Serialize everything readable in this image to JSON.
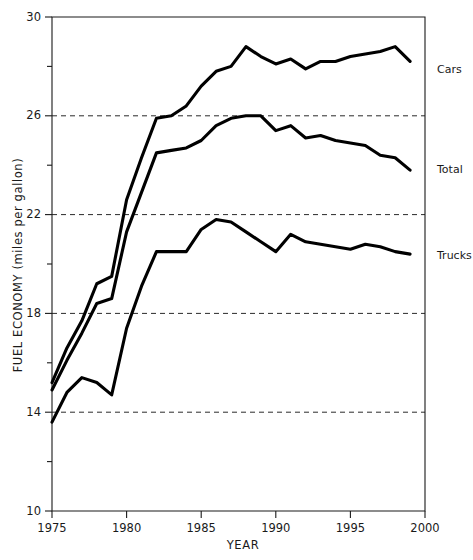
{
  "chart_data": {
    "type": "line",
    "title": "",
    "xlabel": "YEAR",
    "ylabel": "FUEL ECONOMY (miles per gallon)",
    "xlim": [
      1975,
      2000
    ],
    "ylim": [
      10,
      30
    ],
    "grid": true,
    "gridlines_y": [
      14,
      18,
      22,
      26
    ],
    "legend_position": "right-inline-labels",
    "x_major_ticks": [
      1975,
      1980,
      1985,
      1990,
      1995,
      2000
    ],
    "x_major_tick_labels": [
      "1975",
      "1980",
      "1985",
      "1990",
      "1995",
      "2000"
    ],
    "y_major_ticks": [
      10,
      14,
      18,
      22,
      26,
      30
    ],
    "y_major_tick_labels": [
      "10",
      "14",
      "18",
      "22",
      "26",
      "30"
    ],
    "y_minor_ticks": [
      12,
      16,
      20,
      24,
      28
    ],
    "x": [
      1975,
      1976,
      1977,
      1978,
      1979,
      1980,
      1981,
      1982,
      1983,
      1984,
      1985,
      1986,
      1987,
      1988,
      1989,
      1990,
      1991,
      1992,
      1993,
      1994,
      1995,
      1996,
      1997,
      1998,
      1999
    ],
    "series": [
      {
        "name": "Cars",
        "label": "Cars",
        "color": "#000000",
        "values": [
          15.2,
          16.6,
          17.7,
          19.2,
          19.5,
          22.6,
          24.3,
          25.9,
          26.0,
          26.4,
          27.2,
          27.8,
          28.0,
          28.8,
          28.4,
          28.1,
          28.3,
          27.9,
          28.2,
          28.2,
          28.4,
          28.5,
          28.6,
          28.8,
          28.2
        ]
      },
      {
        "name": "Total",
        "label": "Total",
        "color": "#000000",
        "values": [
          14.9,
          16.1,
          17.2,
          18.4,
          18.6,
          21.3,
          22.9,
          24.5,
          24.6,
          24.7,
          25.0,
          25.6,
          25.9,
          26.0,
          26.0,
          25.4,
          25.6,
          25.1,
          25.2,
          25.0,
          24.9,
          24.8,
          24.4,
          24.3,
          23.8
        ]
      },
      {
        "name": "Trucks",
        "label": "Trucks",
        "color": "#000000",
        "values": [
          13.6,
          14.8,
          15.4,
          15.2,
          14.7,
          17.4,
          19.1,
          20.5,
          20.5,
          20.5,
          21.4,
          21.8,
          21.7,
          21.3,
          20.9,
          20.5,
          21.2,
          20.9,
          20.8,
          20.7,
          20.6,
          20.8,
          20.7,
          20.5,
          20.4
        ]
      }
    ]
  },
  "axes": {
    "ylabel": "FUEL ECONOMY (miles per gallon)",
    "xlabel": "YEAR"
  }
}
